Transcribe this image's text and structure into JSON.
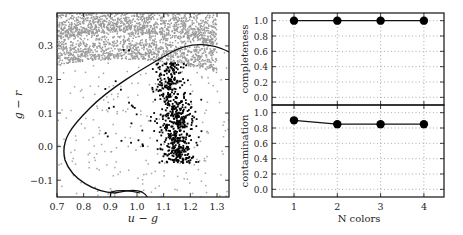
{
  "chart_data": [
    {
      "type": "scatter",
      "title": "",
      "xlabel": "u − g",
      "ylabel": "g − r",
      "xlim": [
        0.7,
        1.345
      ],
      "ylim": [
        -0.15,
        0.398
      ],
      "xticks": [
        "0.7",
        "0.8",
        "0.9",
        "1.0",
        "1.1",
        "1.2",
        "1.3"
      ],
      "yticks": [
        "−0.1",
        "0.0",
        "0.1",
        "0.2",
        "0.3"
      ],
      "grid": false,
      "series": [
        {
          "name": "background",
          "color": "#999999",
          "description": "dense gray points concentrated at g−r > 0.25, sparse elsewhere"
        },
        {
          "name": "selected",
          "color": "#000000",
          "description": "black points clustered around u−g ≈ 1.1–1.2, g−r ≈ −0.05–0.25"
        }
      ],
      "annotations": [
        "closed black contour boundary enclosing the black cluster"
      ]
    },
    {
      "type": "line",
      "title": "",
      "xlabel": "",
      "ylabel": "completeness",
      "x": [
        1,
        2,
        3,
        4
      ],
      "values": [
        1.0,
        1.0,
        1.0,
        1.0
      ],
      "ylim": [
        -0.1,
        1.1
      ],
      "yticks": [
        "0.0",
        "0.2",
        "0.4",
        "0.6",
        "0.8",
        "1.0"
      ],
      "grid": true
    },
    {
      "type": "line",
      "title": "",
      "xlabel": "N colors",
      "ylabel": "contamination",
      "x": [
        1,
        2,
        3,
        4
      ],
      "values": [
        0.9,
        0.85,
        0.85,
        0.85
      ],
      "ylim": [
        -0.1,
        1.1
      ],
      "xticks": [
        "1",
        "2",
        "3",
        "4"
      ],
      "yticks": [
        "0.0",
        "0.2",
        "0.4",
        "0.6",
        "0.8",
        "1.0"
      ],
      "grid": true
    }
  ],
  "left": {
    "xlabel": "u − g",
    "ylabel": "g − r",
    "xticks": [
      "0.7",
      "0.8",
      "0.9",
      "1.0",
      "1.1",
      "1.2",
      "1.3"
    ],
    "yticks": [
      "−0.1",
      "0.0",
      "0.1",
      "0.2",
      "0.3"
    ]
  },
  "right": {
    "top_ylabel": "completeness",
    "bottom_ylabel": "contamination",
    "xlabel": "N colors",
    "xticks": [
      "1",
      "2",
      "3",
      "4"
    ],
    "yticks": [
      "0.0",
      "0.2",
      "0.4",
      "0.6",
      "0.8",
      "1.0"
    ]
  }
}
